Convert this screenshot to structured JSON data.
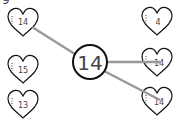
{
  "worksheet": {
    "partial_top_char": "9",
    "center": {
      "value": "14"
    },
    "left_hearts": [
      {
        "value": "14",
        "matched": true
      },
      {
        "value": "15",
        "matched": false
      },
      {
        "value": "13",
        "matched": false
      }
    ],
    "right_hearts": [
      {
        "value": "4",
        "matched": false
      },
      {
        "value": "14",
        "matched": true
      },
      {
        "value": "14",
        "matched": true
      }
    ],
    "colors": {
      "outline": "#111111",
      "line": "#999999",
      "text": "#444444"
    }
  }
}
